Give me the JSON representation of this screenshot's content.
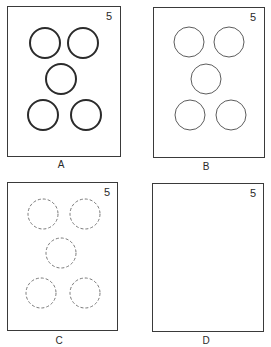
{
  "panels": [
    {
      "id": "A",
      "label": "A",
      "number": "5",
      "circle_style": "thick-solid"
    },
    {
      "id": "B",
      "label": "B",
      "number": "5",
      "circle_style": "thin-solid"
    },
    {
      "id": "C",
      "label": "C",
      "number": "5",
      "circle_style": "dashed"
    },
    {
      "id": "D",
      "label": "D",
      "number": "5",
      "circle_style": "none"
    }
  ],
  "circle_count": 5
}
